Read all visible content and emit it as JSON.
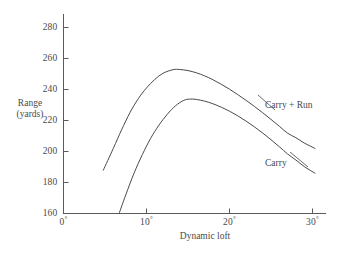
{
  "chart_data": {
    "type": "line",
    "title": "",
    "subtitle": "",
    "xlabel": "Dynamic loft",
    "ylabel": "Range\n(yards)",
    "ylabel_line1": "Range",
    "ylabel_line2": "(yards)",
    "xlim": [
      0,
      32
    ],
    "ylim": [
      160,
      290
    ],
    "grid": false,
    "legend_position": "inline-right",
    "xticks": [
      0,
      10,
      20,
      30
    ],
    "xtick_labels": [
      "0°",
      "10°",
      "20°",
      "30°"
    ],
    "xtick_values": [
      "0",
      "10",
      "20",
      "30"
    ],
    "xtick_unit": "°",
    "yticks": [
      160,
      180,
      200,
      220,
      240,
      260,
      280
    ],
    "ytick_labels": [
      "160",
      "180",
      "200",
      "220",
      "240",
      "260",
      "280"
    ],
    "series": [
      {
        "name": "Carry + Run",
        "color": "#4a4a4a",
        "label_x": 27.0,
        "label_y": 231,
        "x": [
          4.8,
          6.0,
          7.0,
          8.0,
          9.0,
          10.0,
          11.0,
          12.0,
          13.2,
          14.0,
          15.0,
          16.0,
          17.0,
          18.0,
          19.0,
          20.0,
          21.0,
          22.0,
          23.0,
          24.0,
          25.0,
          26.0,
          27.0,
          28.0,
          29.0,
          30.3
        ],
        "y": [
          188.0,
          202.0,
          214.0,
          225.0,
          234.0,
          241.0,
          246.5,
          250.5,
          252.8,
          252.9,
          252.2,
          250.8,
          248.8,
          246.3,
          243.4,
          240.2,
          236.7,
          233.0,
          229.1,
          225.0,
          220.7,
          216.3,
          211.8,
          208.9,
          205.5,
          202.0
        ]
      },
      {
        "name": "Carry",
        "color": "#4a4a4a",
        "label_x": 27.0,
        "label_y": 194,
        "x": [
          6.7,
          7.5,
          8.5,
          9.5,
          10.5,
          11.5,
          12.5,
          13.5,
          14.5,
          15.2,
          16.0,
          17.0,
          18.0,
          19.0,
          20.0,
          21.0,
          22.0,
          23.0,
          24.0,
          25.0,
          26.0,
          27.0,
          28.0,
          29.0,
          30.3
        ],
        "y": [
          160.0,
          172.0,
          186.0,
          198.0,
          208.5,
          217.0,
          224.0,
          229.5,
          233.0,
          233.8,
          233.6,
          232.5,
          230.8,
          228.6,
          226.0,
          223.0,
          219.6,
          215.9,
          211.9,
          207.6,
          203.1,
          198.4,
          194.5,
          190.3,
          186.0
        ]
      }
    ],
    "annotations": [
      {
        "text": "Carry + Run",
        "x": 27.0,
        "y": 231
      },
      {
        "text": "Carry",
        "x": 27.0,
        "y": 194
      }
    ]
  }
}
